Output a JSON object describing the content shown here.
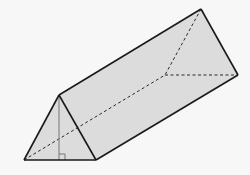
{
  "figure": {
    "colors": {
      "background": "#f7f7f7",
      "face_fill": "#dcdcdc",
      "edge": "#1a1a1a",
      "height_line": "#777777"
    },
    "vertices": {
      "front_apex": [
        59,
        95
      ],
      "front_left": [
        24,
        160
      ],
      "front_right": [
        96,
        160
      ],
      "back_apex": [
        201,
        9
      ],
      "back_right": [
        238,
        75
      ],
      "back_left": [
        165,
        75
      ]
    },
    "features": [
      "hidden edges dashed",
      "altitude of front triangle",
      "right-angle marker"
    ]
  }
}
